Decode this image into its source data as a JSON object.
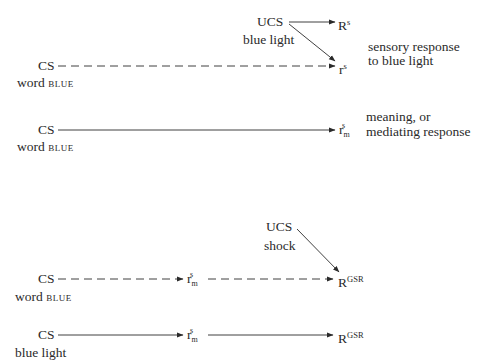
{
  "panels": [
    {
      "ucs": {
        "label": "UCS",
        "stimulus": "blue light"
      },
      "cs": {
        "label": "CS",
        "stimulus_prefix": "word",
        "stimulus_word": "blue"
      },
      "responses": {
        "unconditioned": {
          "base": "R",
          "sup": "s"
        },
        "conditioned": {
          "base": "r",
          "sup": "s"
        }
      },
      "annotation": {
        "line1": "sensory response",
        "line2": "to blue light"
      },
      "cs_arrow_style": "dashed"
    },
    {
      "cs": {
        "label": "CS",
        "stimulus_prefix": "word",
        "stimulus_word": "blue"
      },
      "responses": {
        "mediating": {
          "base": "r",
          "sup": "s",
          "sub": "m"
        }
      },
      "annotation": {
        "line1": "meaning, or",
        "line2": "mediating response"
      },
      "cs_arrow_style": "solid"
    },
    {
      "ucs": {
        "label": "UCS",
        "stimulus": "shock"
      },
      "cs": {
        "label": "CS",
        "stimulus_prefix": "word",
        "stimulus_word": "blue"
      },
      "responses": {
        "mediating": {
          "base": "r",
          "sup": "s",
          "sub": "m"
        },
        "gsr": {
          "base": "R",
          "sup": "GSR"
        }
      },
      "cs_arrow_style": "dashed"
    },
    {
      "cs": {
        "label": "CS",
        "stimulus": "blue light"
      },
      "responses": {
        "mediating": {
          "base": "r",
          "sup": "s",
          "sub": "m"
        },
        "gsr": {
          "base": "R",
          "sup": "GSR"
        }
      },
      "cs_arrow_style": "solid"
    }
  ],
  "colors": {
    "ink": "#2a2a2a",
    "background": "#ffffff"
  }
}
